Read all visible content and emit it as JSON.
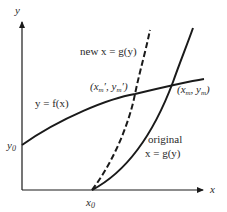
{
  "axes": {
    "x_label": "x",
    "y_label": "y"
  },
  "labels": {
    "y0": "y",
    "y0_sub": "0",
    "x0": "x",
    "x0_sub": "0",
    "f_curve": "y = f(x)",
    "new_g_curve": "new x = g(y)",
    "original_line1": "original",
    "original_line2": "x = g(y)",
    "new_intersection": "(x",
    "new_intersection_sub1": "m",
    "new_intersection_mid": "′, y",
    "new_intersection_sub2": "m",
    "new_intersection_end": "′)",
    "orig_intersection": "(x",
    "orig_intersection_sub1": "m",
    "orig_intersection_mid": ", y",
    "orig_intersection_sub2": "m",
    "orig_intersection_end": ")"
  },
  "colors": {
    "line": "#1a1a1a",
    "text": "#2a2a2a"
  }
}
